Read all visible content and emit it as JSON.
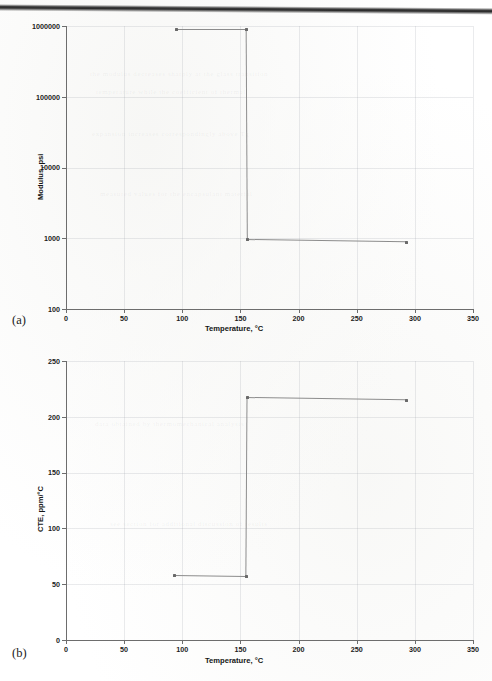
{
  "figure": {
    "panels": [
      {
        "id": "a",
        "label": "(a)"
      },
      {
        "id": "b",
        "label": "(b)"
      }
    ]
  },
  "chart_data": [
    {
      "type": "line",
      "panel": "(a)",
      "title": "",
      "xlabel": "Temperature, °C",
      "ylabel": "Modulus, psi",
      "xlim": [
        0,
        350
      ],
      "ylim": [
        100,
        1000000
      ],
      "yscale": "log",
      "xscale": "linear",
      "grid": true,
      "legend": "none",
      "xticks": [
        "0",
        "50",
        "100",
        "150",
        "200",
        "250",
        "300",
        "350"
      ],
      "xtick_values": [
        0,
        50,
        100,
        150,
        200,
        250,
        300,
        350
      ],
      "yticks": [
        "100",
        "1000",
        "10000",
        "100000",
        "1000000"
      ],
      "ytick_values": [
        100,
        1000,
        10000,
        100000,
        1000000
      ],
      "series": [
        {
          "name": "Modulus",
          "x": [
            95,
            155,
            156,
            293
          ],
          "y": [
            900000,
            900000,
            950,
            880
          ],
          "markers": [
            true,
            true,
            true,
            true
          ]
        }
      ]
    },
    {
      "type": "line",
      "panel": "(b)",
      "title": "",
      "xlabel": "Temperature, °C",
      "ylabel": "CTE, ppm/°C",
      "xlim": [
        0,
        350
      ],
      "ylim": [
        0,
        250
      ],
      "yscale": "linear",
      "xscale": "linear",
      "grid": true,
      "legend": "none",
      "xticks": [
        "0",
        "50",
        "100",
        "150",
        "200",
        "250",
        "300",
        "350"
      ],
      "xtick_values": [
        0,
        50,
        100,
        150,
        200,
        250,
        300,
        350
      ],
      "yticks": [
        "0",
        "50",
        "100",
        "150",
        "200",
        "250"
      ],
      "ytick_values": [
        0,
        50,
        100,
        150,
        200,
        250
      ],
      "series": [
        {
          "name": "CTE",
          "x": [
            93,
            155,
            156,
            293
          ],
          "y": [
            58,
            57,
            217,
            215
          ],
          "markers": [
            true,
            true,
            true,
            true
          ]
        }
      ]
    }
  ],
  "background_artifacts": {
    "ghost_lines": [
      "the modulus decreases sharply at the glass transition",
      "temperature while the coefficient of thermal",
      "expansion increases correspondingly above Tg",
      "measured values for the encapsulant material",
      "data obtained by thermomechanical analysis",
      "see section for additional discussion of results"
    ]
  }
}
